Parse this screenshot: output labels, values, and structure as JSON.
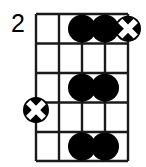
{
  "diagram": {
    "type": "guitar-chord-diagram",
    "fret_number_label": "2",
    "strings": 5,
    "frets": 5,
    "colors": {
      "line": "#1a1a1a",
      "dot_fill": "#000000",
      "x_marker_fill": "#000000",
      "x_marker_cross": "#ffffff",
      "background": "#ffffff",
      "text": "#000000"
    },
    "geometry": {
      "grid_left": 36,
      "grid_top": 14,
      "grid_right": 128,
      "grid_bottom": 161,
      "string_x": [
        36,
        59,
        82,
        105,
        128
      ],
      "fret_y": [
        14,
        43.5,
        73,
        102.5,
        132,
        161
      ],
      "dot_radius": 14,
      "x_marker_radius": 13,
      "line_width": 2.4,
      "nut_width": 2.4
    },
    "markers": [
      {
        "name": "dot-string3-fret1",
        "kind": "filled-dot",
        "string": 3,
        "fret": 1,
        "cx": 82,
        "cy": 28.7
      },
      {
        "name": "dot-string4-fret1",
        "kind": "filled-dot",
        "string": 4,
        "fret": 1,
        "cx": 105,
        "cy": 28.7
      },
      {
        "name": "x-marker-string5-fret1",
        "kind": "x-marker",
        "string": 5,
        "fret": 1,
        "cx": 128,
        "cy": 28.7
      },
      {
        "name": "dot-string3-fret3",
        "kind": "filled-dot",
        "string": 3,
        "fret": 3,
        "cx": 82,
        "cy": 87.7
      },
      {
        "name": "dot-string4-fret3",
        "kind": "filled-dot",
        "string": 4,
        "fret": 3,
        "cx": 105,
        "cy": 87.7
      },
      {
        "name": "x-marker-string1-fret4",
        "kind": "x-marker",
        "string": 1,
        "fret": 4,
        "cx": 36,
        "cy": 110
      },
      {
        "name": "dot-string3-fret5",
        "kind": "filled-dot",
        "string": 3,
        "fret": 5,
        "cx": 82,
        "cy": 146.5
      },
      {
        "name": "dot-string4-fret5",
        "kind": "filled-dot",
        "string": 4,
        "fret": 5,
        "cx": 105,
        "cy": 146.5
      }
    ]
  }
}
